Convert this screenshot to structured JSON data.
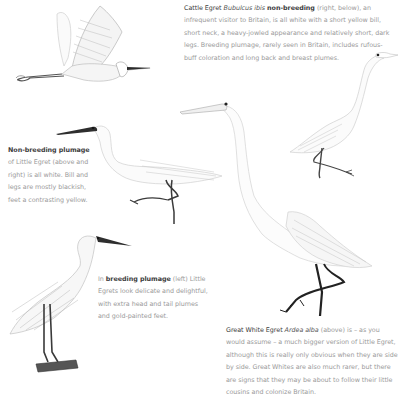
{
  "captions": {
    "cattle_egret": {
      "species": "Cattle Egret",
      "latin": "Bubulcus ibis",
      "lead": "non-breeding",
      "text": "(right, below), an infrequent visitor to Britain, is all white with a short yellow bill, short neck, a heavy-jowled appearance and relatively short, dark legs. Breeding plumage, rarely seen in Britain, includes rufous-buff coloration and long back and breast plumes."
    },
    "non_breeding": {
      "lead": "Non-breeding plumage",
      "text": "of Little Egret (above and right) is all white. Bill and legs are mostly blackish, feet a contrasting yellow."
    },
    "breeding": {
      "prefix": "In",
      "lead": "breeding plumage",
      "text": "(left) Little Egrets look delicate and delightful, with extra head and tail plumes and gold-painted feet."
    },
    "great_white": {
      "species": "Great White Egret",
      "latin": "Ardea alba",
      "text": "(above) is – as you would assume – a much bigger version of Little Egret, although this is really only obvious when they are side by side. Great Whites are also much rarer, but there are signs that they may be about to follow their little cousins and colonize Britain."
    }
  },
  "illustrations": [
    {
      "id": "little-egret-flying",
      "label": "Little Egret in flight"
    },
    {
      "id": "cattle-egret-standing",
      "label": "Cattle Egret non-breeding"
    },
    {
      "id": "little-egret-walking",
      "label": "Little Egret non-breeding"
    },
    {
      "id": "great-white-egret",
      "label": "Great White Egret"
    },
    {
      "id": "little-egret-breeding",
      "label": "Little Egret breeding plumage"
    }
  ],
  "colors": {
    "ink": "#2b2b2b",
    "sketch": "#c8c8c8",
    "text_body": "#9a9a9a",
    "text_lead": "#3c3c3c"
  }
}
